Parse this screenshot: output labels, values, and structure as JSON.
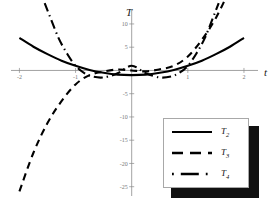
{
  "chart_data": {
    "type": "line",
    "title": "",
    "xlabel": "t",
    "ylabel": "T",
    "xlim": [
      -2.15,
      2.25
    ],
    "ylim": [
      -27,
      13
    ],
    "grid": false,
    "legend_position": "bottom-right",
    "xticks": [
      -2,
      -1,
      1,
      2
    ],
    "xtick_labels": [
      "-2",
      "-1",
      "1",
      "2"
    ],
    "yticks": [
      10,
      5,
      -5,
      -10,
      -15,
      -20,
      -25
    ],
    "ytick_labels": [
      "10",
      "5",
      "-5",
      "-10",
      "-15",
      "-20",
      "-25"
    ],
    "series": [
      {
        "name": "T2",
        "label": "T",
        "sub": "2",
        "style": "solid",
        "x": [
          -2.0,
          -1.75,
          -1.5,
          -1.25,
          -1.0,
          -0.75,
          -0.5,
          -0.25,
          0.0,
          0.25,
          0.5,
          0.75,
          1.0,
          1.25,
          1.5,
          1.75,
          2.0
        ],
        "y": [
          7.0,
          5.1,
          3.5,
          2.1,
          1.0,
          0.1,
          -0.5,
          -0.9,
          -1.0,
          -0.9,
          -0.5,
          0.1,
          1.0,
          2.1,
          3.5,
          5.1,
          7.0
        ]
      },
      {
        "name": "T3",
        "label": "T",
        "sub": "3",
        "style": "dashed",
        "x": [
          -2.0,
          -1.75,
          -1.5,
          -1.25,
          -1.0,
          -0.75,
          -0.5,
          -0.25,
          0.0,
          0.25,
          0.5,
          0.75,
          1.0,
          1.25,
          1.5,
          1.75,
          2.0
        ],
        "y": [
          -26.0,
          -17.7,
          -11.3,
          -6.6,
          -3.0,
          -1.0,
          -0.25,
          0.2,
          0.0,
          -0.2,
          0.25,
          1.0,
          3.0,
          6.6,
          11.3,
          17.7,
          26.0
        ]
      },
      {
        "name": "T4",
        "label": "T",
        "sub": "4",
        "style": "dash-dot",
        "x": [
          -1.55,
          -1.45,
          -1.3,
          -1.15,
          -1.0,
          -0.85,
          -0.7,
          -0.5,
          -0.25,
          0.0,
          0.25,
          0.5,
          0.7,
          0.85,
          1.0,
          1.15,
          1.3,
          1.45,
          1.55
        ],
        "y": [
          14.5,
          11.4,
          6.9,
          3.6,
          1.0,
          -0.5,
          -1.3,
          -1.5,
          -0.6,
          1.0,
          -0.6,
          -1.5,
          -1.3,
          -0.5,
          1.0,
          3.6,
          6.9,
          11.4,
          14.5
        ]
      }
    ]
  },
  "legend": {
    "items": [
      {
        "label": "T",
        "sub": "2",
        "style": "solid"
      },
      {
        "label": "T",
        "sub": "3",
        "style": "dashed"
      },
      {
        "label": "T",
        "sub": "4",
        "style": "dash-dot"
      }
    ]
  },
  "colors": {
    "curve": "#000000",
    "axis": "#8a8a8a",
    "tick_text": "#777777",
    "legend_shadow": "#111111",
    "background": "#ffffff"
  }
}
